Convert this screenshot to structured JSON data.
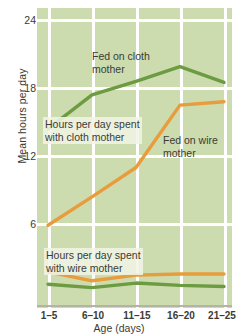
{
  "chart_data": {
    "type": "line",
    "title": "",
    "xlabel": "Age (days)",
    "ylabel": "Mean hours per day",
    "categories": [
      "1–5",
      "6–10",
      "11–15",
      "16–20",
      "21–25"
    ],
    "ylim": [
      0,
      25
    ],
    "yticks": [
      6,
      12,
      18,
      24
    ],
    "ytick_labels": [
      "6",
      "12",
      "18",
      "24"
    ],
    "grid": true,
    "legend_position": "inline-annotations",
    "series": [
      {
        "name": "Hours per day spent with cloth mother",
        "color": "#6d9b41",
        "values": [
          14.3,
          17.3,
          18.5,
          19.8,
          18.4
        ]
      },
      {
        "name": "Hours per day spent with wire mother",
        "color": "#6d9b41",
        "values": [
          0.6,
          0.3,
          0.7,
          0.5,
          0.4
        ]
      },
      {
        "name": "Fed on wire mother",
        "color": "#e89c3b",
        "values": [
          5.8,
          8.3,
          10.9,
          16.4,
          16.7
        ]
      },
      {
        "name": "Fed on wire mother (time with wire mother)",
        "color": "#e89c3b",
        "values": [
          1.7,
          0.9,
          1.4,
          1.5,
          1.5
        ]
      }
    ],
    "annotations": [
      {
        "id": "fed-on-cloth-mother",
        "text": "Fed on cloth\nmother",
        "x": 92,
        "y": 50,
        "boxed": false
      },
      {
        "id": "hours-cloth-mother",
        "text": "Hours per day spent\nwith cloth mother",
        "x": 43,
        "y": 117,
        "boxed": true
      },
      {
        "id": "fed-on-wire-mother",
        "text": "Fed on wire\nmother",
        "x": 163,
        "y": 134,
        "boxed": false
      },
      {
        "id": "hours-wire-mother",
        "text": "Hours per day spent\nwith wire mother",
        "x": 44,
        "y": 248,
        "boxed": true
      }
    ]
  },
  "colors": {
    "plot_background": "#ccdcaf",
    "gridline": "#ffffff",
    "axis": "#b3b3a6",
    "cloth_line": "#6d9b41",
    "wire_line": "#e89c3b",
    "text": "#3b3b33"
  }
}
